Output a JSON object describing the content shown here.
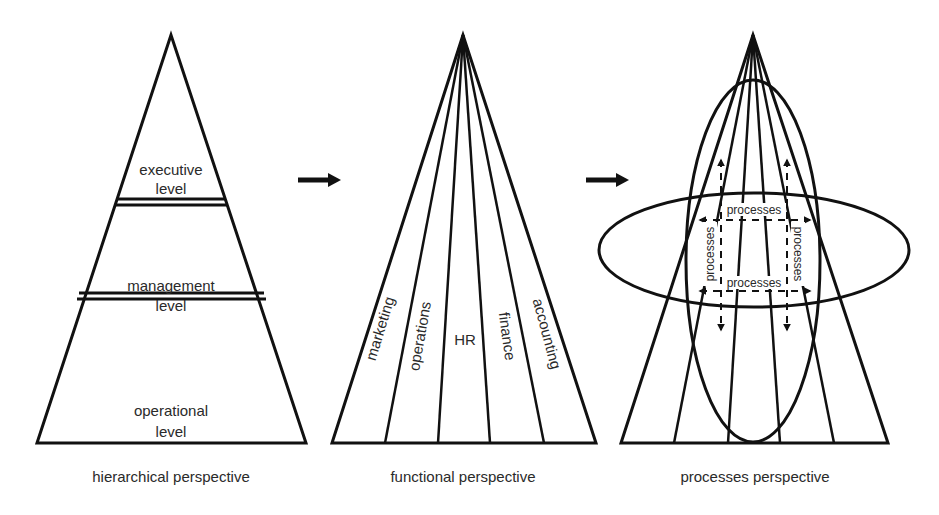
{
  "panels": [
    {
      "id": "hierarchical",
      "caption": "hierarchical perspective",
      "levels": [
        {
          "line1": "executive",
          "line2": "level"
        },
        {
          "line1": "management",
          "line2": "level"
        },
        {
          "line1": "operational",
          "line2": "level"
        }
      ]
    },
    {
      "id": "functional",
      "caption": "functional perspective",
      "functions": [
        "marketing",
        "operations",
        "HR",
        "finance",
        "accounting"
      ]
    },
    {
      "id": "processes",
      "caption": "processes perspective",
      "process_labels": {
        "top": "processes",
        "bottom": "processes",
        "left": "processes",
        "right": "processes"
      }
    }
  ],
  "arrows": [
    {
      "from": "hierarchical",
      "to": "functional",
      "icon": "right-arrow-icon"
    },
    {
      "from": "functional",
      "to": "processes",
      "icon": "right-arrow-icon"
    }
  ]
}
